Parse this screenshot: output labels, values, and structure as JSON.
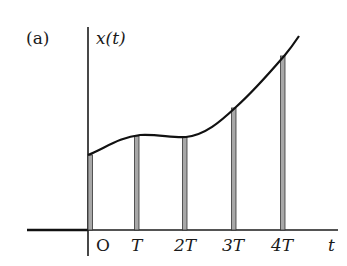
{
  "figure": {
    "panel_label": "(a)",
    "y_axis_label": "x(t)",
    "x_axis_label": "t",
    "tick_labels": [
      "O",
      "T",
      "2T",
      "3T",
      "4T"
    ],
    "colors": {
      "axis": "#1a1a1a",
      "curve": "#111111",
      "sample_bar_fill": "#a8a8a8",
      "sample_bar_stroke": "#333333"
    }
  },
  "samples": [
    {
      "label": "O",
      "x": 90,
      "top": 155
    },
    {
      "label": "T",
      "x": 137,
      "top": 136
    },
    {
      "label": "2T",
      "x": 185,
      "top": 137
    },
    {
      "label": "3T",
      "x": 234,
      "top": 108
    },
    {
      "label": "4T",
      "x": 283,
      "top": 56
    }
  ]
}
